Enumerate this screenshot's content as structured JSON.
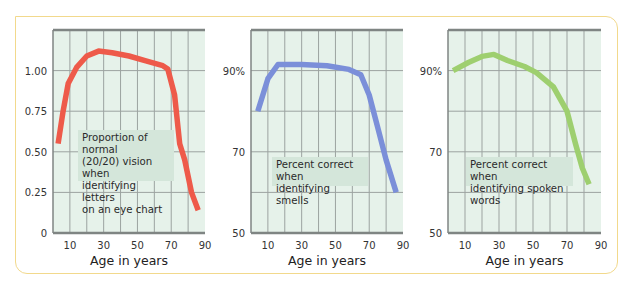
{
  "chart_data": [
    {
      "type": "line",
      "title": "",
      "xlabel": "Age in years",
      "ylabel": "",
      "x_ticks": [
        "10",
        "30",
        "50",
        "70",
        "90"
      ],
      "x_tick_values": [
        10,
        30,
        50,
        70,
        90
      ],
      "y_ticks": [
        "0",
        "0.25",
        "0.50",
        "0.75",
        "1.00"
      ],
      "y_tick_values": [
        0,
        0.25,
        0.5,
        0.75,
        1.0
      ],
      "xlim": [
        0,
        90
      ],
      "ylim": [
        0,
        1.25
      ],
      "grid": true,
      "annotation": "Proportion of normal\n(20/20) vision when\nidentifying letters\non an eye chart",
      "series": [
        {
          "name": "Proportion of normal (20/20) vision when identifying letters on an eye chart",
          "color": "#ee5a4a",
          "x": [
            3,
            6,
            9,
            14,
            20,
            27,
            35,
            45,
            55,
            65,
            68,
            72,
            75,
            78,
            82,
            86
          ],
          "values": [
            0.55,
            0.75,
            0.92,
            1.02,
            1.09,
            1.12,
            1.11,
            1.09,
            1.06,
            1.03,
            1.01,
            0.85,
            0.55,
            0.45,
            0.25,
            0.14
          ]
        }
      ]
    },
    {
      "type": "line",
      "title": "",
      "xlabel": "Age in years",
      "ylabel": "",
      "x_ticks": [
        "10",
        "30",
        "50",
        "70",
        "90"
      ],
      "x_tick_values": [
        10,
        30,
        50,
        70,
        90
      ],
      "y_ticks": [
        "50",
        "70",
        "90%"
      ],
      "y_tick_values": [
        50,
        70,
        90
      ],
      "xlim": [
        0,
        90
      ],
      "ylim": [
        50,
        100
      ],
      "grid": true,
      "annotation": "Percent correct when\nidentifying smells",
      "series": [
        {
          "name": "Percent correct when identifying smells",
          "color": "#7b8fd9",
          "x": [
            4,
            10,
            16,
            30,
            45,
            58,
            65,
            70,
            75,
            80,
            86
          ],
          "values": [
            80,
            88,
            91.5,
            91.5,
            91.2,
            90.3,
            89,
            84,
            76,
            68,
            60
          ]
        }
      ]
    },
    {
      "type": "line",
      "title": "",
      "xlabel": "Age in years",
      "ylabel": "",
      "x_ticks": [
        "10",
        "30",
        "50",
        "70",
        "90"
      ],
      "x_tick_values": [
        10,
        30,
        50,
        70,
        90
      ],
      "y_ticks": [
        "50",
        "70",
        "90%"
      ],
      "y_tick_values": [
        50,
        70,
        90
      ],
      "xlim": [
        0,
        90
      ],
      "ylim": [
        50,
        100
      ],
      "grid": true,
      "annotation": "Percent correct when\nidentifying spoken words",
      "series": [
        {
          "name": "Percent correct when identifying spoken words",
          "color": "#9ecf6f",
          "x": [
            3,
            12,
            20,
            27,
            35,
            45,
            52,
            62,
            70,
            75,
            79,
            83
          ],
          "values": [
            90,
            92,
            93.5,
            94,
            92.5,
            91,
            89.5,
            86,
            80,
            72,
            66,
            62
          ]
        }
      ]
    }
  ],
  "colors": {
    "frame": "#f2d98c",
    "plot_bg": "#e6f2ea",
    "grid": "#9ca3a0",
    "axis": "#7f8583",
    "note_bg": "#d4e6da"
  }
}
